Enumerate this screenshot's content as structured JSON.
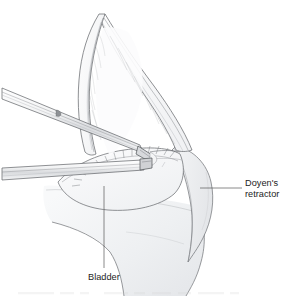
{
  "figure": {
    "kind": "medical-surgical-illustration",
    "background_color": "#ffffff",
    "ink_color": "#3a3a3a",
    "shade_color": "#e9eaec",
    "label_color": "#1d1d1d"
  },
  "labels": [
    {
      "id": "doyens-retractor",
      "line1": "Doyen's",
      "line2": "retractor",
      "x": 245,
      "y": 184,
      "leader": {
        "x1": 200,
        "y1": 188,
        "x2": 242,
        "y2": 188
      }
    },
    {
      "id": "bladder",
      "line1": "Bladder",
      "line2": "",
      "x": 88,
      "y": 278,
      "leader": {
        "x1": 104,
        "y1": 186,
        "x2": 104,
        "y2": 268
      }
    }
  ],
  "structures": [
    {
      "id": "peritoneal-fold",
      "name": "Peritoneal fold"
    },
    {
      "id": "uterus-body",
      "name": "Uterus"
    },
    {
      "id": "bladder-body",
      "name": "Bladder"
    },
    {
      "id": "doyen-retractor-blade",
      "name": "Doyen's retractor blade"
    }
  ],
  "instruments": [
    {
      "id": "upper-forceps",
      "name": "Dissecting forceps",
      "entry": "upper-left"
    },
    {
      "id": "lower-forceps",
      "name": "Tissue forceps",
      "entry": "lower-left"
    }
  ],
  "caption": {
    "text": "",
    "visible": false
  }
}
